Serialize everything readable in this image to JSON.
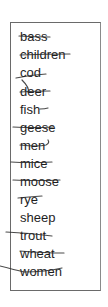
{
  "word_list": {
    "words": [
      {
        "text": "bass",
        "crossed": true
      },
      {
        "text": "children",
        "crossed": true
      },
      {
        "text": "cod",
        "crossed": true
      },
      {
        "text": "deer",
        "crossed": true
      },
      {
        "text": "fish",
        "crossed": true
      },
      {
        "text": "geese",
        "crossed": true
      },
      {
        "text": "men",
        "crossed": true
      },
      {
        "text": "mice",
        "crossed": true
      },
      {
        "text": "moose",
        "crossed": true
      },
      {
        "text": "rye",
        "crossed": true
      },
      {
        "text": "sheep",
        "crossed": false
      },
      {
        "text": "trout",
        "crossed": true
      },
      {
        "text": "wheat",
        "crossed": true
      },
      {
        "text": "women",
        "crossed": true
      }
    ]
  },
  "colors": {
    "text": "#1e1e1e",
    "border": "#6a6a6a",
    "strike": "#2a2a2a",
    "background": "#ffffff"
  }
}
